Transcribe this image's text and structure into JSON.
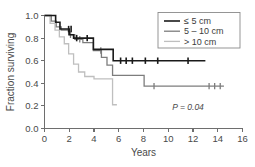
{
  "chart_data": {
    "type": "line",
    "subtype": "kaplan-meier-survival",
    "title": "",
    "xlabel": "Years",
    "ylabel": "Fraction surviving",
    "xlim": [
      0,
      16
    ],
    "ylim": [
      0.0,
      1.0
    ],
    "xticks": [
      0,
      2,
      4,
      6,
      8,
      10,
      12,
      14,
      16
    ],
    "xtick_labels": [
      "0",
      "2",
      "4",
      "6",
      "8",
      "10",
      "12",
      "14",
      "16"
    ],
    "yticks": [
      0.0,
      0.2,
      0.4,
      0.6,
      0.8,
      1.0
    ],
    "ytick_labels": [
      "0.0",
      "0.2",
      "0.4",
      "0.6",
      "0.8",
      "1.0"
    ],
    "grid": false,
    "legend_position": "top-right",
    "annotations": [
      {
        "text": "P = 0.04",
        "x": 11.6,
        "y": 0.16
      }
    ],
    "series": [
      {
        "name": "≤ 5 cm",
        "color": "#1a1a1a",
        "linewidth": 1.6,
        "steps": [
          [
            0.0,
            1.0
          ],
          [
            0.9,
            1.0
          ],
          [
            0.9,
            0.94
          ],
          [
            1.25,
            0.94
          ],
          [
            1.25,
            0.88
          ],
          [
            2.0,
            0.88
          ],
          [
            2.0,
            0.83
          ],
          [
            2.35,
            0.83
          ],
          [
            2.35,
            0.8
          ],
          [
            3.95,
            0.8
          ],
          [
            3.95,
            0.7
          ],
          [
            5.55,
            0.7
          ],
          [
            5.55,
            0.6
          ],
          [
            13.0,
            0.6
          ]
        ],
        "censor_points": [
          [
            1.95,
            0.88
          ],
          [
            2.15,
            0.88
          ],
          [
            2.6,
            0.8
          ],
          [
            3.45,
            0.8
          ],
          [
            6.15,
            0.6
          ],
          [
            6.6,
            0.6
          ],
          [
            7.1,
            0.6
          ],
          [
            8.15,
            0.6
          ],
          [
            9.15,
            0.6
          ],
          [
            11.6,
            0.6
          ]
        ]
      },
      {
        "name": "5 – 10 cm",
        "color": "#7d7d7d",
        "linewidth": 1.3,
        "steps": [
          [
            0.0,
            1.0
          ],
          [
            0.55,
            1.0
          ],
          [
            0.55,
            0.95
          ],
          [
            0.95,
            0.95
          ],
          [
            0.95,
            0.9
          ],
          [
            1.35,
            0.9
          ],
          [
            1.35,
            0.87
          ],
          [
            1.95,
            0.87
          ],
          [
            1.95,
            0.83
          ],
          [
            2.45,
            0.83
          ],
          [
            2.45,
            0.79
          ],
          [
            3.1,
            0.79
          ],
          [
            3.1,
            0.76
          ],
          [
            3.95,
            0.76
          ],
          [
            3.95,
            0.69
          ],
          [
            4.6,
            0.69
          ],
          [
            4.6,
            0.63
          ],
          [
            5.05,
            0.63
          ],
          [
            5.05,
            0.56
          ],
          [
            5.5,
            0.56
          ],
          [
            5.5,
            0.47
          ],
          [
            8.05,
            0.47
          ],
          [
            8.05,
            0.375
          ],
          [
            14.5,
            0.375
          ]
        ],
        "censor_points": [
          [
            2.1,
            0.83
          ],
          [
            2.85,
            0.79
          ],
          [
            4.55,
            0.69
          ],
          [
            8.85,
            0.375
          ],
          [
            13.3,
            0.375
          ],
          [
            13.75,
            0.375
          ],
          [
            14.2,
            0.375
          ]
        ]
      },
      {
        "name": "> 10 cm",
        "color": "#bfbfbf",
        "linewidth": 1.3,
        "steps": [
          [
            0.0,
            1.0
          ],
          [
            0.45,
            1.0
          ],
          [
            0.45,
            0.93
          ],
          [
            0.85,
            0.93
          ],
          [
            0.85,
            0.87
          ],
          [
            1.2,
            0.87
          ],
          [
            1.2,
            0.81
          ],
          [
            1.6,
            0.81
          ],
          [
            1.6,
            0.75
          ],
          [
            1.95,
            0.75
          ],
          [
            1.95,
            0.66
          ],
          [
            2.35,
            0.66
          ],
          [
            2.35,
            0.57
          ],
          [
            2.75,
            0.57
          ],
          [
            2.75,
            0.5
          ],
          [
            3.25,
            0.5
          ],
          [
            3.25,
            0.46
          ],
          [
            4.0,
            0.46
          ],
          [
            4.0,
            0.44
          ],
          [
            5.5,
            0.44
          ],
          [
            5.5,
            0.21
          ],
          [
            5.85,
            0.21
          ]
        ],
        "censor_points": []
      }
    ]
  },
  "legend": {
    "items": [
      {
        "label": "≤ 5 cm",
        "color": "#1a1a1a"
      },
      {
        "label": "5 – 10 cm",
        "color": "#7d7d7d"
      },
      {
        "label": "> 10 cm",
        "color": "#bfbfbf"
      }
    ]
  },
  "axes": {
    "x_title": "Years",
    "y_title": "Fraction surviving"
  },
  "stats": {
    "p_value_text": "P = 0.04"
  }
}
